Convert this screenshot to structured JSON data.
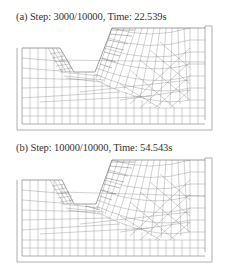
{
  "figure": {
    "panels": [
      {
        "id": "a",
        "caption": "(a) Step: 3000/10000, Time: 22.539s",
        "step": 3000,
        "total_steps": 10000,
        "time_s": 22.539
      },
      {
        "id": "b",
        "caption": "(b) Step: 10000/10000, Time: 54.543s",
        "step": 10000,
        "total_steps": 10000,
        "time_s": 54.543
      }
    ],
    "colors": {
      "mesh_line": "#8a8a8a",
      "dense_mesh": "#555555",
      "container": "#9a9a9a",
      "caption_text": "#333333",
      "background": "#ffffff"
    }
  }
}
